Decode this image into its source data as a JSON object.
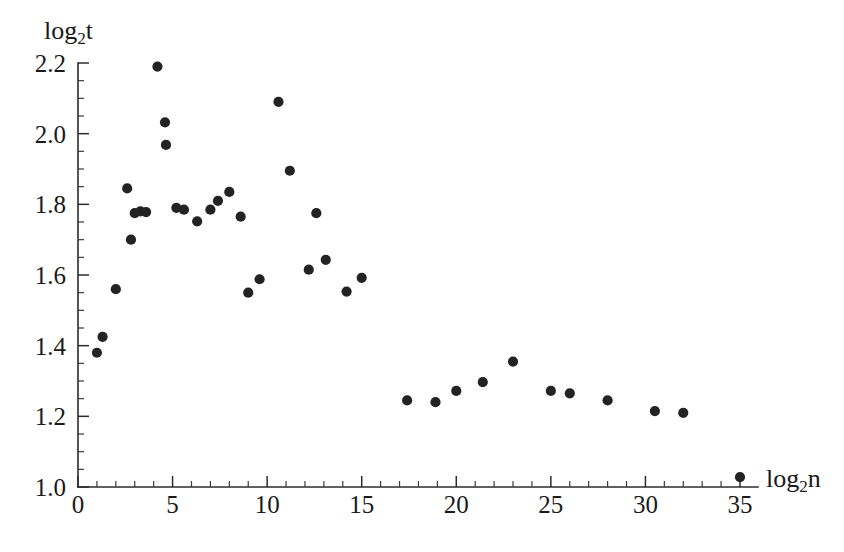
{
  "chart_data": {
    "type": "scatter",
    "title": "",
    "xlabel": "log2 n",
    "ylabel": "log2 t",
    "xlabel_base": "log",
    "xlabel_sub": "2",
    "xlabel_var": "n",
    "ylabel_base": "log",
    "ylabel_sub": "2",
    "ylabel_var": "t",
    "xlim": [
      0,
      35.6
    ],
    "ylim": [
      1.0,
      2.24
    ],
    "grid": false,
    "legend": null,
    "xticks": [
      0,
      5,
      10,
      15,
      20,
      25,
      30,
      35
    ],
    "xticklabels": [
      "0",
      "5",
      "10",
      "15",
      "20",
      "25",
      "30",
      "35"
    ],
    "x_minor_step": 1,
    "yticks": [
      1.0,
      1.2,
      1.4,
      1.6,
      1.8,
      2.0,
      2.2
    ],
    "yticklabels": [
      "1.0",
      "1.2",
      "1.4",
      "1.6",
      "1.8",
      "2.0",
      "2.2"
    ],
    "y_minor_step": 0.05,
    "marker": "filled-circle",
    "marker_color": "#232323",
    "marker_size": 9,
    "points": [
      [
        1.0,
        1.38
      ],
      [
        1.3,
        1.425
      ],
      [
        2.0,
        1.56
      ],
      [
        2.6,
        1.845
      ],
      [
        2.8,
        1.7
      ],
      [
        3.0,
        1.775
      ],
      [
        3.3,
        1.78
      ],
      [
        3.6,
        1.778
      ],
      [
        4.2,
        2.19
      ],
      [
        4.6,
        2.032
      ],
      [
        4.65,
        1.968
      ],
      [
        5.2,
        1.79
      ],
      [
        5.6,
        1.785
      ],
      [
        6.3,
        1.752
      ],
      [
        7.0,
        1.785
      ],
      [
        7.4,
        1.81
      ],
      [
        8.0,
        1.835
      ],
      [
        8.6,
        1.765
      ],
      [
        9.0,
        1.55
      ],
      [
        9.6,
        1.588
      ],
      [
        10.6,
        2.09
      ],
      [
        11.2,
        1.895
      ],
      [
        12.2,
        1.615
      ],
      [
        12.6,
        1.775
      ],
      [
        13.1,
        1.643
      ],
      [
        14.2,
        1.553
      ],
      [
        15.0,
        1.592
      ],
      [
        17.4,
        1.245
      ],
      [
        18.9,
        1.24
      ],
      [
        20.0,
        1.272
      ],
      [
        21.4,
        1.297
      ],
      [
        23.0,
        1.355
      ],
      [
        25.0,
        1.272
      ],
      [
        26.0,
        1.265
      ],
      [
        28.0,
        1.245
      ],
      [
        30.5,
        1.215
      ],
      [
        32.0,
        1.21
      ],
      [
        35.0,
        1.028
      ]
    ]
  },
  "axes_geometry": {
    "x_pixel_at_0": 78,
    "x_pixel_at_35": 740,
    "y_pixel_at_1_0": 487,
    "y_pixel_at_2_2": 63
  }
}
